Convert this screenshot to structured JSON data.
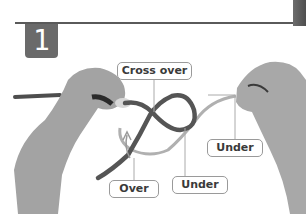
{
  "header": {
    "step_number": "1"
  },
  "illustration": {
    "description": "Two hands holding a rope forming a figure-eight knot crossing",
    "labels": [
      {
        "id": "cross-over",
        "text": "Cross over"
      },
      {
        "id": "over",
        "text": "Over"
      },
      {
        "id": "under-bottom",
        "text": "Under"
      },
      {
        "id": "under-right",
        "text": "Under"
      }
    ]
  },
  "colors": {
    "badge": "#6a6a6a",
    "rule": "#5a5a5a",
    "rope_dark": "#5a5a5a",
    "rope_light": "#a8a8a8",
    "skin": "#9c9c9c",
    "label_border": "#9a9a9a"
  }
}
